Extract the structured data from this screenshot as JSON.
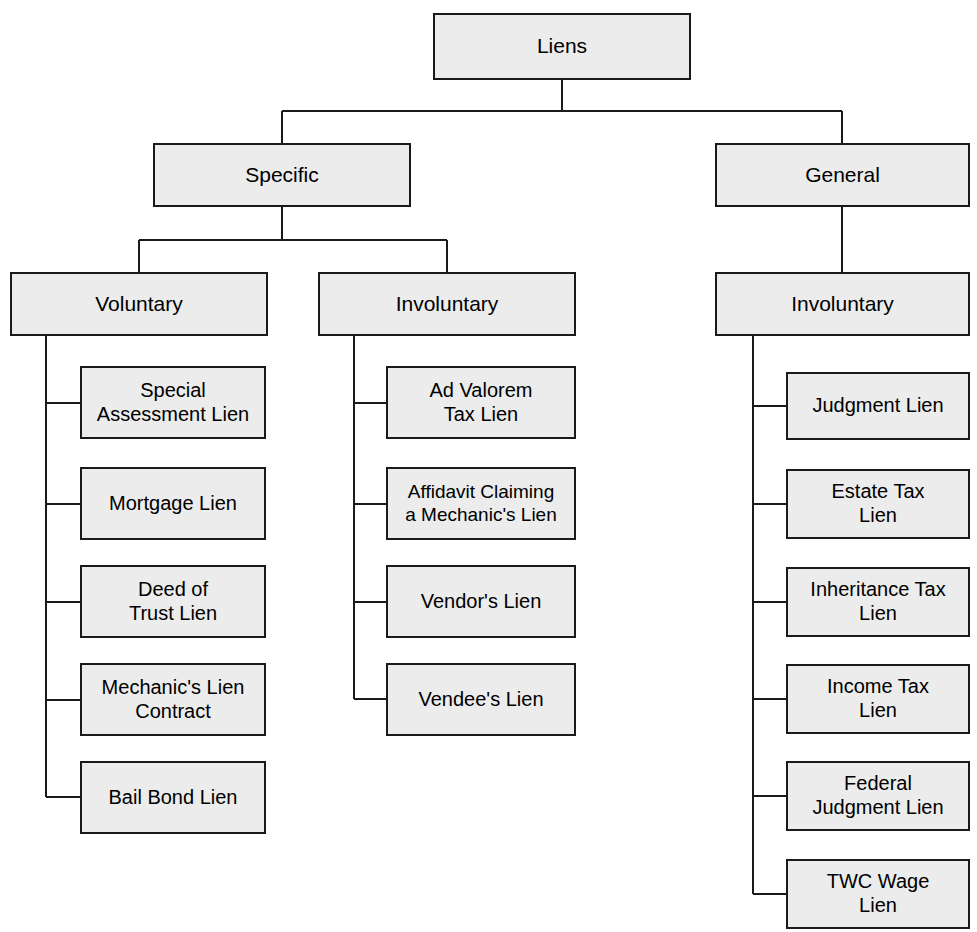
{
  "diagram": {
    "title": "Liens",
    "type": "hierarchy-tree",
    "colors": {
      "node_fill": "#ececec",
      "node_border": "#1a1a1a",
      "connector": "#1a1a1a",
      "background": "#ffffff",
      "text": "#000000"
    },
    "nodes": [
      {
        "id": "liens",
        "label": "Liens",
        "level": "root",
        "x": 433,
        "y": 13,
        "w": 258,
        "h": 67
      },
      {
        "id": "specific",
        "label": "Specific",
        "level": "branch",
        "x": 153,
        "y": 143,
        "w": 258,
        "h": 64
      },
      {
        "id": "general",
        "label": "General",
        "level": "branch",
        "x": 715,
        "y": 143,
        "w": 255,
        "h": 64
      },
      {
        "id": "specific-voluntary",
        "label": "Voluntary",
        "level": "branch",
        "x": 10,
        "y": 272,
        "w": 258,
        "h": 64
      },
      {
        "id": "specific-involuntary",
        "label": "Involuntary",
        "level": "branch",
        "x": 318,
        "y": 272,
        "w": 258,
        "h": 64
      },
      {
        "id": "general-involuntary",
        "label": "Involuntary",
        "level": "branch",
        "x": 715,
        "y": 272,
        "w": 255,
        "h": 64
      },
      {
        "id": "special-assessment-lien",
        "label": "Special\nAssessment Lien",
        "level": "leaf",
        "x": 80,
        "y": 366,
        "w": 186,
        "h": 73
      },
      {
        "id": "mortgage-lien",
        "label": "Mortgage Lien",
        "level": "leaf",
        "x": 80,
        "y": 467,
        "w": 186,
        "h": 73
      },
      {
        "id": "deed-of-trust-lien",
        "label": "Deed of\nTrust Lien",
        "level": "leaf",
        "x": 80,
        "y": 565,
        "w": 186,
        "h": 73
      },
      {
        "id": "mechanics-lien-contract",
        "label": "Mechanic's Lien\nContract",
        "level": "leaf",
        "x": 80,
        "y": 663,
        "w": 186,
        "h": 73
      },
      {
        "id": "bail-bond-lien",
        "label": "Bail Bond Lien",
        "level": "leaf",
        "x": 80,
        "y": 761,
        "w": 186,
        "h": 73
      },
      {
        "id": "ad-valorem-tax-lien",
        "label": "Ad Valorem\nTax Lien",
        "level": "leaf",
        "x": 386,
        "y": 366,
        "w": 190,
        "h": 73
      },
      {
        "id": "affidavit-claiming-a-mechanics-lien",
        "label": "Affidavit Claiming\na Mechanic's Lien",
        "level": "leaf",
        "x": 386,
        "y": 467,
        "w": 190,
        "h": 73
      },
      {
        "id": "vendors-lien",
        "label": "Vendor's Lien",
        "level": "leaf",
        "x": 386,
        "y": 565,
        "w": 190,
        "h": 73
      },
      {
        "id": "vendees-lien",
        "label": "Vendee's Lien",
        "level": "leaf",
        "x": 386,
        "y": 663,
        "w": 190,
        "h": 73
      },
      {
        "id": "judgment-lien",
        "label": "Judgment Lien",
        "level": "leaf",
        "x": 786,
        "y": 372,
        "w": 184,
        "h": 68
      },
      {
        "id": "estate-tax-lien",
        "label": "Estate Tax\nLien",
        "level": "leaf",
        "x": 786,
        "y": 469,
        "w": 184,
        "h": 70
      },
      {
        "id": "inheritance-tax-lien",
        "label": "Inheritance Tax\nLien",
        "level": "leaf",
        "x": 786,
        "y": 567,
        "w": 184,
        "h": 70
      },
      {
        "id": "income-tax-lien",
        "label": "Income Tax\nLien",
        "level": "leaf",
        "x": 786,
        "y": 664,
        "w": 184,
        "h": 70
      },
      {
        "id": "federal-judgment-lien",
        "label": "Federal\nJudgment Lien",
        "level": "leaf",
        "x": 786,
        "y": 761,
        "w": 184,
        "h": 70
      },
      {
        "id": "twc-wage-lien",
        "label": "TWC Wage\nLien",
        "level": "leaf",
        "x": 786,
        "y": 859,
        "w": 184,
        "h": 70
      }
    ],
    "edges": [
      {
        "from": "liens",
        "to": "specific",
        "style": "orthogonal-down"
      },
      {
        "from": "liens",
        "to": "general",
        "style": "orthogonal-down"
      },
      {
        "from": "specific",
        "to": "specific-voluntary",
        "style": "orthogonal-down"
      },
      {
        "from": "specific",
        "to": "specific-involuntary",
        "style": "orthogonal-down"
      },
      {
        "from": "general",
        "to": "general-involuntary",
        "style": "straight-down"
      },
      {
        "from": "specific-voluntary",
        "to": "special-assessment-lien",
        "style": "spine-left"
      },
      {
        "from": "specific-voluntary",
        "to": "mortgage-lien",
        "style": "spine-left"
      },
      {
        "from": "specific-voluntary",
        "to": "deed-of-trust-lien",
        "style": "spine-left"
      },
      {
        "from": "specific-voluntary",
        "to": "mechanics-lien-contract",
        "style": "spine-left"
      },
      {
        "from": "specific-voluntary",
        "to": "bail-bond-lien",
        "style": "spine-left"
      },
      {
        "from": "specific-involuntary",
        "to": "ad-valorem-tax-lien",
        "style": "spine-left"
      },
      {
        "from": "specific-involuntary",
        "to": "affidavit-claiming-a-mechanics-lien",
        "style": "spine-left"
      },
      {
        "from": "specific-involuntary",
        "to": "vendors-lien",
        "style": "spine-left"
      },
      {
        "from": "specific-involuntary",
        "to": "vendees-lien",
        "style": "spine-left"
      },
      {
        "from": "general-involuntary",
        "to": "judgment-lien",
        "style": "spine-left"
      },
      {
        "from": "general-involuntary",
        "to": "estate-tax-lien",
        "style": "spine-left"
      },
      {
        "from": "general-involuntary",
        "to": "inheritance-tax-lien",
        "style": "spine-left"
      },
      {
        "from": "general-involuntary",
        "to": "income-tax-lien",
        "style": "spine-left"
      },
      {
        "from": "general-involuntary",
        "to": "federal-judgment-lien",
        "style": "spine-left"
      },
      {
        "from": "general-involuntary",
        "to": "twc-wage-lien",
        "style": "spine-left"
      }
    ]
  }
}
